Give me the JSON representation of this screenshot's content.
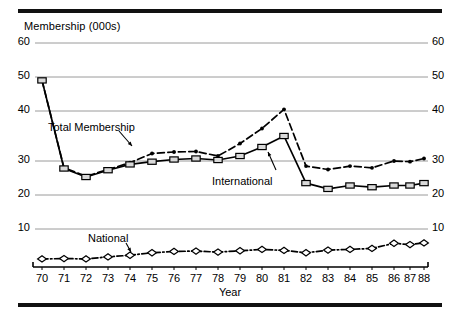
{
  "figure": {
    "title": "Membership (000s)",
    "xlabel": "Year",
    "rule_color": "#111111",
    "grid_color": "#9a9a9a",
    "axis_color": "#000000"
  },
  "annotations": [
    {
      "name": "total-membership",
      "label": "Total Membership"
    },
    {
      "name": "international",
      "label": "International"
    },
    {
      "name": "national",
      "label": "National"
    }
  ],
  "chart_data": {
    "type": "line",
    "title": "Membership (000s)",
    "xlabel": "Year",
    "ylabel": "Membership (000s)",
    "grid": true,
    "legend": "inline-annotations",
    "ylim": [
      0,
      60
    ],
    "yticks": [
      10,
      20,
      30,
      40,
      50,
      60
    ],
    "ytick_labels": [
      "10",
      "20",
      "30",
      "40",
      "50",
      "60"
    ],
    "y_axis_both_sides": true,
    "x": [
      1970,
      1971,
      1972,
      1973,
      1974,
      1975,
      1976,
      1977,
      1978,
      1979,
      1980,
      1981,
      1982,
      1983,
      1984,
      1985,
      1986,
      1987,
      1988
    ],
    "xtick_labels": [
      "70",
      "71",
      "72",
      "73",
      "74",
      "75",
      "76",
      "77",
      "78",
      "79",
      "80",
      "81",
      "82",
      "83",
      "84",
      "85",
      "86",
      "87",
      "88"
    ],
    "series": [
      {
        "name": "Total Membership",
        "style": "dashed",
        "marker": "dot",
        "values": [
          49.0,
          28.0,
          25.5,
          27.5,
          29.5,
          31.5,
          31.8,
          31.9,
          31.0,
          33.5,
          36.5,
          40.5,
          28.5,
          27.5,
          28.5,
          28.0,
          30.0,
          29.8,
          30.5
        ]
      },
      {
        "name": "International",
        "style": "solid",
        "marker": "open-square",
        "values": [
          49.0,
          27.8,
          25.3,
          27.3,
          29.0,
          29.8,
          30.3,
          30.5,
          30.2,
          31.0,
          32.8,
          35.0,
          23.5,
          21.8,
          22.8,
          22.3,
          22.8,
          22.8,
          23.5
        ]
      },
      {
        "name": "National",
        "style": "dash-dot",
        "marker": "open-diamond",
        "values": [
          1.2,
          1.3,
          1.2,
          1.8,
          2.3,
          3.0,
          3.4,
          3.5,
          3.2,
          3.6,
          4.0,
          3.7,
          3.0,
          3.8,
          4.0,
          4.3,
          5.8,
          5.4,
          5.9
        ]
      }
    ]
  }
}
